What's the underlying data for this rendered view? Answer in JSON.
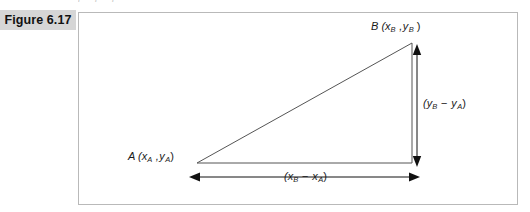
{
  "figure": {
    "label": "Figure 6.17",
    "ghost_text_above": "i i i",
    "frame": {
      "x": 78,
      "y": 12,
      "width": 440,
      "height": 193,
      "border_color": "#b9b9b9"
    },
    "label_band_color": "#d6d6d6",
    "line_color": "#555555",
    "arrow_color": "#111111"
  },
  "diagram": {
    "type": "right-triangle-distance-formula",
    "points": [
      {
        "name": "A",
        "role": "lower-left-vertex",
        "x": 197,
        "y": 163,
        "label_text": "A (x",
        "sub1": "A",
        "mid": " ,y",
        "sub2": "A",
        "close": ")"
      },
      {
        "name": "B",
        "role": "upper-right-vertex",
        "x": 412,
        "y": 43,
        "label_text": "B (x",
        "sub1": "B",
        "mid": " ,y",
        "sub2": "B",
        "close": " )"
      },
      {
        "name": "C",
        "role": "right-angle-vertex",
        "x": 412,
        "y": 163
      }
    ],
    "horizontal_dimension": {
      "label_prefix": "(x",
      "sub_from": "B",
      "operator": " − x",
      "sub_to": "A",
      "label_suffix": ")",
      "arrow_left_x": 190,
      "arrow_right_x": 419,
      "arrow_y": 177,
      "double_headed": true
    },
    "vertical_dimension": {
      "label_prefix": "(y",
      "sub_from": "B",
      "operator": " − y",
      "sub_to": "A",
      "label_suffix": ")",
      "arrow_x": 417,
      "arrow_top_y": 45,
      "arrow_bottom_y": 166,
      "double_headed": true
    }
  }
}
